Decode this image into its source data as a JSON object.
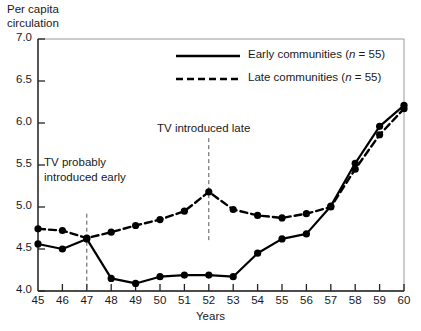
{
  "chart_data": {
    "type": "line",
    "title": "",
    "ylabel": "Per capita\ncirculation",
    "xlabel": "Years",
    "x": [
      45,
      46,
      47,
      48,
      49,
      50,
      51,
      52,
      53,
      54,
      55,
      56,
      57,
      58,
      59,
      60
    ],
    "xlim": [
      45,
      60
    ],
    "ylim": [
      4.0,
      7.0
    ],
    "yticks": [
      "7.0",
      "6.5",
      "6.0",
      "5.5",
      "5.0",
      "4.5",
      "4.0"
    ],
    "ytick_values": [
      7.0,
      6.5,
      6.0,
      5.5,
      5.0,
      4.5,
      4.0
    ],
    "xticks": [
      "45",
      "46",
      "47",
      "48",
      "49",
      "50",
      "51",
      "52",
      "53",
      "54",
      "55",
      "56",
      "57",
      "58",
      "59",
      "60"
    ],
    "grid": false,
    "legend_position": "upper-center",
    "series": [
      {
        "name": "Early communities (n = 55)",
        "label_prefix": "Early communities (",
        "label_n": "n",
        "label_suffix": " = 55)",
        "style": "solid",
        "color": "#000000",
        "marker": "circle",
        "values": [
          4.56,
          4.5,
          4.62,
          4.15,
          4.09,
          4.17,
          4.19,
          4.19,
          4.17,
          4.45,
          4.62,
          4.68,
          5.01,
          5.52,
          5.96,
          6.21
        ]
      },
      {
        "name": "Late communities (n = 55)",
        "label_prefix": "Late communities (",
        "label_n": "n",
        "label_suffix": " = 55)",
        "style": "dashed",
        "color": "#000000",
        "marker": "circle",
        "values": [
          4.74,
          4.72,
          4.63,
          4.7,
          4.78,
          4.85,
          4.95,
          5.18,
          4.97,
          4.9,
          4.87,
          4.92,
          5.0,
          5.45,
          5.86,
          6.17
        ]
      }
    ],
    "annotations": [
      {
        "id": "tv-early",
        "text": "TV probably\nintroduced early",
        "line_x": 47,
        "line_style": "dashed",
        "line_y_top": 4.92,
        "line_y_bottom": 4.0
      },
      {
        "id": "tv-late",
        "text": "TV introduced late",
        "line_x": 52,
        "line_style": "dashed",
        "line_y_top": 5.82,
        "line_y_bottom": 4.57
      }
    ]
  },
  "legend": {
    "early": {
      "prefix": "Early communities (",
      "italic": "n",
      "suffix": " = 55)"
    },
    "late": {
      "prefix": "Late communities (",
      "italic": "n",
      "suffix": " = 55)"
    }
  },
  "labels": {
    "y_axis_line1": "Per capita",
    "y_axis_line2": "circulation",
    "x_axis": "Years",
    "annot_early_line1": "TV probably",
    "annot_early_line2": "introduced early",
    "annot_late": "TV introduced late"
  }
}
